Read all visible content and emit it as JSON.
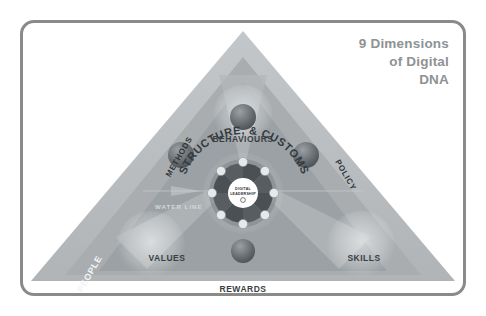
{
  "title": {
    "line1": "9 Dimensions",
    "line2": "of Digital",
    "line3": "DNA"
  },
  "diagram": {
    "arc_label": "STRUCTURE, & CUSTOMS",
    "water_line": "WATER LINE",
    "edges": [
      {
        "name": "methods",
        "label": "METHODS"
      },
      {
        "name": "policy",
        "label": "POLICY"
      },
      {
        "name": "people",
        "label": "PEOPLE"
      }
    ],
    "nodes": [
      {
        "name": "behaviours",
        "label": "BEHAVIOURS"
      },
      {
        "name": "values",
        "label": "VALUES"
      },
      {
        "name": "skills",
        "label": "SKILLS"
      },
      {
        "name": "rewards",
        "label": "REWARDS"
      }
    ],
    "hub": {
      "line1": "DIGITAL",
      "line2": "LEADERSHIP"
    },
    "colors": {
      "frame": "#8a8a8a",
      "triangle_outer": "#b9bdc0",
      "triangle_mid": "#a7abae",
      "triangle_inner": "#9aa0a3",
      "sphere": "#6f7579",
      "title": "#8e9295",
      "hub_bg": "#ffffff",
      "wheel": "#5b6165"
    }
  }
}
